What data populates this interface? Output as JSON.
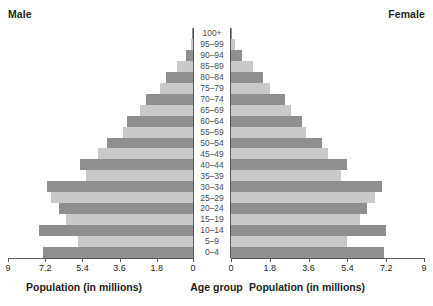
{
  "titles": {
    "male": "Male",
    "female": "Female"
  },
  "captions": {
    "left": "Population (in millions)",
    "center": "Age group",
    "right": "Population (in millions)"
  },
  "chart_data": {
    "type": "bar",
    "subtype": "population-pyramid",
    "title": "",
    "xlabel": "Population (in millions)",
    "ylabel": "Age group",
    "categories": [
      "0–4",
      "5–9",
      "10–14",
      "15–19",
      "20–24",
      "25–29",
      "30–34",
      "35–39",
      "40–44",
      "45–49",
      "50–54",
      "55–59",
      "60–64",
      "65–69",
      "70–74",
      "75–79",
      "80–84",
      "85–89",
      "90–94",
      "95–99",
      "100+"
    ],
    "tick_labels_left": [
      "9",
      "7.2",
      "5.4",
      "3.6",
      "1.8",
      "0"
    ],
    "tick_values_left": [
      9,
      7.2,
      5.4,
      3.6,
      1.8,
      0
    ],
    "tick_labels_right": [
      "0",
      "1.8",
      "3.6",
      "5.4",
      "7.2",
      "9"
    ],
    "tick_values_right": [
      0,
      1.8,
      3.6,
      5.4,
      7.2,
      9
    ],
    "xlim": [
      0,
      9
    ],
    "grid": false,
    "legend_position": "top-outside",
    "colors": {
      "bar_dark": "#8f8f8f",
      "bar_light": "#c9c9c9",
      "axis": "#58595b",
      "text": "#231f20",
      "age_label_text": "#4d4d4f",
      "background": "#ffffff"
    },
    "series": [
      {
        "name": "Male",
        "side": "left",
        "values": [
          7.3,
          5.6,
          7.5,
          6.2,
          6.5,
          6.9,
          7.1,
          5.2,
          5.5,
          4.6,
          4.2,
          3.4,
          3.2,
          2.6,
          2.3,
          1.6,
          1.3,
          0.8,
          0.35,
          0.12,
          0.03
        ]
      },
      {
        "name": "Female",
        "side": "right",
        "values": [
          7.1,
          5.4,
          7.2,
          6.0,
          6.3,
          6.7,
          7.0,
          5.1,
          5.4,
          4.5,
          4.2,
          3.5,
          3.3,
          2.8,
          2.5,
          1.8,
          1.5,
          1.0,
          0.5,
          0.2,
          0.06
        ]
      }
    ]
  }
}
